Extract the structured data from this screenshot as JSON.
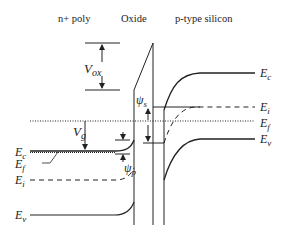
{
  "headers": {
    "gate": "n+ poly",
    "oxide": "Oxide",
    "substrate": "p-type silicon"
  },
  "labels": {
    "vox": {
      "main": "V",
      "sub": "ox"
    },
    "vg": {
      "main": "V",
      "sub": "g"
    },
    "psi_s": {
      "main": "ψ",
      "sub": "s"
    },
    "psi_p": {
      "main": "ψ",
      "sub": "p"
    },
    "gate_ec": {
      "main": "E",
      "sub": "c"
    },
    "gate_ef": {
      "main": "E",
      "sub": "f"
    },
    "gate_ei": {
      "main": "E",
      "sub": "i"
    },
    "gate_ev": {
      "main": "E",
      "sub": "v"
    },
    "sub_ec": {
      "main": "E",
      "sub": "c"
    },
    "sub_ei": {
      "main": "E",
      "sub": "i"
    },
    "sub_ef": {
      "main": "E",
      "sub": "f"
    },
    "sub_ev": {
      "main": "E",
      "sub": "v"
    }
  },
  "colors": {
    "line": "#222222",
    "background": "#ffffff"
  }
}
